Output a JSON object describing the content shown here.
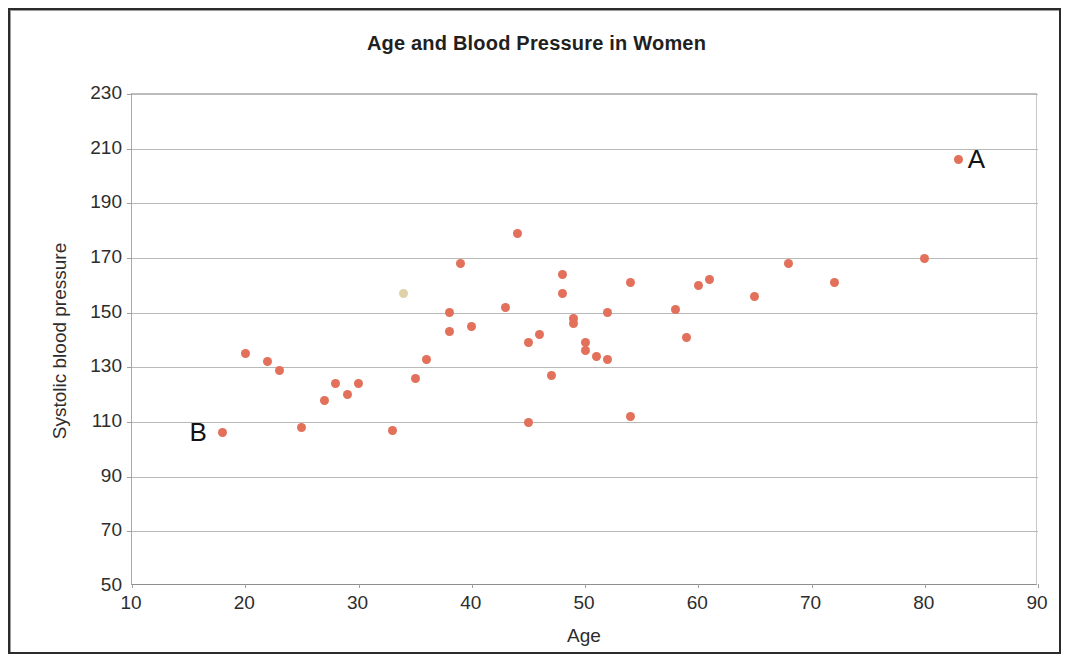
{
  "document": {
    "border_color": "#2b2b2b",
    "background": "#ffffff"
  },
  "chart_data": {
    "type": "scatter",
    "title": "Age and Blood Pressure in Women",
    "xlabel": "Age",
    "ylabel": "Systolic blood pressure",
    "xlim": [
      10,
      90
    ],
    "ylim": [
      50,
      230
    ],
    "xticks": [
      10,
      20,
      30,
      40,
      50,
      60,
      70,
      80,
      90
    ],
    "yticks": [
      50,
      70,
      90,
      110,
      130,
      150,
      170,
      190,
      210,
      230
    ],
    "grid": "horizontal",
    "legend": "none",
    "marker_color": "#e2705a",
    "marker_faded_color": "#e0d2a8",
    "series": [
      {
        "name": "Women",
        "points": [
          {
            "x": 18,
            "y": 106
          },
          {
            "x": 20,
            "y": 135
          },
          {
            "x": 22,
            "y": 132
          },
          {
            "x": 23,
            "y": 129
          },
          {
            "x": 25,
            "y": 108
          },
          {
            "x": 27,
            "y": 118
          },
          {
            "x": 28,
            "y": 124
          },
          {
            "x": 29,
            "y": 120
          },
          {
            "x": 30,
            "y": 124
          },
          {
            "x": 33,
            "y": 107
          },
          {
            "x": 34,
            "y": 157,
            "faded": true
          },
          {
            "x": 35,
            "y": 126
          },
          {
            "x": 36,
            "y": 133
          },
          {
            "x": 38,
            "y": 150
          },
          {
            "x": 38,
            "y": 143
          },
          {
            "x": 39,
            "y": 168
          },
          {
            "x": 40,
            "y": 145
          },
          {
            "x": 43,
            "y": 152
          },
          {
            "x": 44,
            "y": 179
          },
          {
            "x": 45,
            "y": 110
          },
          {
            "x": 45,
            "y": 139
          },
          {
            "x": 46,
            "y": 142
          },
          {
            "x": 47,
            "y": 127
          },
          {
            "x": 48,
            "y": 164
          },
          {
            "x": 48,
            "y": 157
          },
          {
            "x": 49,
            "y": 148
          },
          {
            "x": 49,
            "y": 146
          },
          {
            "x": 50,
            "y": 139
          },
          {
            "x": 50,
            "y": 136
          },
          {
            "x": 51,
            "y": 134
          },
          {
            "x": 52,
            "y": 150
          },
          {
            "x": 52,
            "y": 133
          },
          {
            "x": 54,
            "y": 161
          },
          {
            "x": 54,
            "y": 112
          },
          {
            "x": 58,
            "y": 151
          },
          {
            "x": 59,
            "y": 141
          },
          {
            "x": 60,
            "y": 160
          },
          {
            "x": 61,
            "y": 162
          },
          {
            "x": 65,
            "y": 156
          },
          {
            "x": 68,
            "y": 168
          },
          {
            "x": 72,
            "y": 161
          },
          {
            "x": 80,
            "y": 170
          },
          {
            "x": 83,
            "y": 206
          }
        ]
      }
    ],
    "annotations": [
      {
        "label": "A",
        "x": 83,
        "y": 206,
        "placement": "right"
      },
      {
        "label": "B",
        "x": 18,
        "y": 106,
        "placement": "left"
      }
    ]
  }
}
